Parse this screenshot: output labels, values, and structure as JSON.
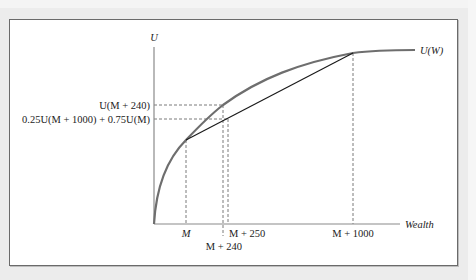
{
  "figure": {
    "y_axis_label": "U",
    "x_axis_label": "Wealth",
    "curve_label": "U(W)",
    "y_ticks": [
      {
        "label": "U(M + 240)",
        "y": 105
      },
      {
        "label": "0.25U(M + 1000) + 0.75U(M)",
        "y": 119
      }
    ],
    "x_ticks": [
      {
        "label": "M",
        "x": 186
      },
      {
        "label": "M + 250",
        "x": 228
      },
      {
        "label": "M + 240",
        "x": 224
      },
      {
        "label": "M + 1000",
        "x": 353
      }
    ]
  },
  "colors": {
    "curve": "#6e6e6e",
    "chord": "#1a1a1a",
    "axis": "#8a8a8a",
    "dashed": "#7a7a7a",
    "text": "#222222",
    "background": "#ececec",
    "panel": "#ffffff"
  }
}
